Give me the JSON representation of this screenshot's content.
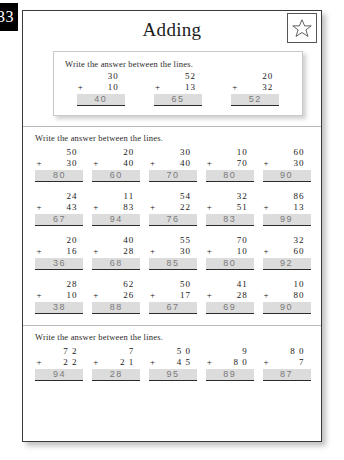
{
  "page": {
    "number": "33",
    "title": "Adding",
    "star_icon": "star-icon"
  },
  "example_section": {
    "instruction": "Write the answer between the lines.",
    "problems": [
      {
        "top": "30",
        "plus": "+",
        "bottom": "10",
        "answer": "40"
      },
      {
        "top": "52",
        "plus": "+",
        "bottom": "13",
        "answer": "65"
      },
      {
        "top": "20",
        "plus": "+",
        "bottom": "32",
        "answer": "52"
      }
    ]
  },
  "main_section": {
    "instruction": "Write the answer between the lines.",
    "rows": [
      [
        {
          "top": "50",
          "plus": "+",
          "bottom": "30",
          "answer": "80"
        },
        {
          "top": "20",
          "plus": "+",
          "bottom": "40",
          "answer": "60"
        },
        {
          "top": "30",
          "plus": "+",
          "bottom": "40",
          "answer": "70"
        },
        {
          "top": "10",
          "plus": "+",
          "bottom": "70",
          "answer": "80"
        },
        {
          "top": "60",
          "plus": "+",
          "bottom": "30",
          "answer": "90"
        }
      ],
      [
        {
          "top": "24",
          "plus": "+",
          "bottom": "43",
          "answer": "67"
        },
        {
          "top": "11",
          "plus": "+",
          "bottom": "83",
          "answer": "94"
        },
        {
          "top": "54",
          "plus": "+",
          "bottom": "22",
          "answer": "76"
        },
        {
          "top": "32",
          "plus": "+",
          "bottom": "51",
          "answer": "83"
        },
        {
          "top": "86",
          "plus": "+",
          "bottom": "13",
          "answer": "99"
        }
      ],
      [
        {
          "top": "20",
          "plus": "+",
          "bottom": "16",
          "answer": "36"
        },
        {
          "top": "40",
          "plus": "+",
          "bottom": "28",
          "answer": "68"
        },
        {
          "top": "55",
          "plus": "+",
          "bottom": "30",
          "answer": "85"
        },
        {
          "top": "70",
          "plus": "+",
          "bottom": "10",
          "answer": "80"
        },
        {
          "top": "32",
          "plus": "+",
          "bottom": "60",
          "answer": "92"
        }
      ],
      [
        {
          "top": "28",
          "plus": "+",
          "bottom": "10",
          "answer": "38"
        },
        {
          "top": "62",
          "plus": "+",
          "bottom": "26",
          "answer": "88"
        },
        {
          "top": "50",
          "plus": "+",
          "bottom": "17",
          "answer": "67"
        },
        {
          "top": "41",
          "plus": "+",
          "bottom": "28",
          "answer": "69"
        },
        {
          "top": "10",
          "plus": "+",
          "bottom": "80",
          "answer": "90"
        }
      ]
    ]
  },
  "bottom_section": {
    "instruction": "Write the answer between the lines.",
    "rows": [
      [
        {
          "top": "7 2",
          "plus": "+",
          "bottom": "2 2",
          "answer": "94"
        },
        {
          "top": "7",
          "plus": "+",
          "bottom": "2 1",
          "answer": "28"
        },
        {
          "top": "5 0",
          "plus": "+",
          "bottom": "4 5",
          "answer": "95"
        },
        {
          "top": "9",
          "plus": "+",
          "bottom": "8 0",
          "answer": "89"
        },
        {
          "top": "8 0",
          "plus": "+",
          "bottom": "7",
          "answer": "87"
        }
      ]
    ]
  }
}
